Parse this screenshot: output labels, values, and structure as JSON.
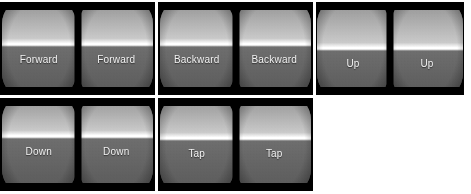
{
  "canvas": {
    "width": 471,
    "height": 194,
    "background": "#ffffff",
    "description": "Grid of five stereoscopic VR headset capture thumbnails, each showing a dual-lens barrel-distorted horizon view with a motion-command caption"
  },
  "palette": {
    "panel_background": "#000000",
    "sky_top": "#8f8f8f",
    "sky_bottom": "#c9c9c9",
    "horizon_band": "#ffffff",
    "ground_top": "#6e6e6e",
    "ground_bottom": "#595959",
    "label_text": "#f2f2f2",
    "page_background": "#ffffff"
  },
  "panels": [
    {
      "id": "panel-forward",
      "command": "Forward",
      "row": 1,
      "column": 1,
      "x": 0,
      "y": 2,
      "width": 155,
      "height": 93,
      "horizon_percent": 46,
      "eyes": [
        {
          "side": "left",
          "label": "Forward"
        },
        {
          "side": "right",
          "label": "Forward"
        }
      ]
    },
    {
      "id": "panel-backward",
      "command": "Backward",
      "row": 1,
      "column": 2,
      "x": 158,
      "y": 2,
      "width": 155,
      "height": 93,
      "horizon_percent": 46,
      "eyes": [
        {
          "side": "left",
          "label": "Backward"
        },
        {
          "side": "right",
          "label": "Backward"
        }
      ]
    },
    {
      "id": "panel-up",
      "command": "Up",
      "row": 1,
      "column": 3,
      "x": 316,
      "y": 2,
      "width": 148,
      "height": 93,
      "horizon_percent": 50,
      "eyes": [
        {
          "side": "left",
          "label": "Up"
        },
        {
          "side": "right",
          "label": "Up"
        }
      ]
    },
    {
      "id": "panel-down",
      "command": "Down",
      "row": 2,
      "column": 1,
      "x": 0,
      "y": 98,
      "width": 155,
      "height": 93,
      "horizon_percent": 42,
      "eyes": [
        {
          "side": "left",
          "label": "Down"
        },
        {
          "side": "right",
          "label": "Down"
        }
      ]
    },
    {
      "id": "panel-tap",
      "command": "Tap",
      "row": 2,
      "column": 2,
      "x": 158,
      "y": 98,
      "width": 155,
      "height": 93,
      "horizon_percent": 44,
      "eyes": [
        {
          "side": "left",
          "label": "Tap"
        },
        {
          "side": "right",
          "label": "Tap"
        }
      ]
    }
  ]
}
